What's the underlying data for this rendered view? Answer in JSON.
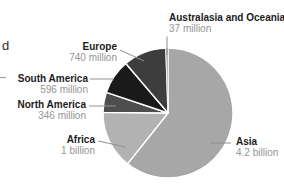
{
  "fragments": {
    "left_text": "d"
  },
  "chart_data": {
    "type": "pie",
    "title": "",
    "unit": "population",
    "direction": "clockwise",
    "start_angle_deg": 0,
    "legend_position": "callout-labels",
    "slices": [
      {
        "label": "Asia",
        "value_text": "4.2 billion",
        "value_millions": 4200,
        "color": "#a7a7a7"
      },
      {
        "label": "Africa",
        "value_text": "1 billion",
        "value_millions": 1000,
        "color": "#b2b2b2"
      },
      {
        "label": "North America",
        "value_text": "346 million",
        "value_millions": 346,
        "color": "#4e4e4e"
      },
      {
        "label": "South America",
        "value_text": "596 million",
        "value_millions": 596,
        "color": "#1a1a1a"
      },
      {
        "label": "Europe",
        "value_text": "740 million",
        "value_millions": 740,
        "color": "#3d3d3d"
      },
      {
        "label": "Australasia and Oceania",
        "value_text": "37 million",
        "value_millions": 37,
        "color": "#9b9b9b"
      }
    ],
    "colors": {
      "label_text": "#1c1c1c",
      "value_text": "#959595",
      "leader_line": "#919191",
      "slice_separator": "#ffffff"
    }
  }
}
